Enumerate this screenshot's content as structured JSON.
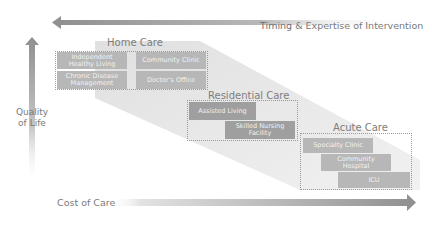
{
  "diagram": {
    "axes": {
      "top": {
        "label_strong": "Timing",
        "label_rest": " & Expertise of Intervention",
        "direction": "left"
      },
      "left": {
        "label_line1": "Quality",
        "label_line2": "of Life",
        "direction": "up"
      },
      "bottom": {
        "label": "Cost of Care",
        "direction": "right"
      }
    },
    "groups": [
      {
        "title": "Home Care",
        "items": [
          {
            "label": "Independent Healthy Living"
          },
          {
            "label": "Chronic Disease Management"
          },
          {
            "label": "Community Clinic"
          },
          {
            "label": "Doctor's Office"
          }
        ]
      },
      {
        "title": "Residential Care",
        "items": [
          {
            "label": "Assisted Living"
          },
          {
            "label": "Skilled Nursing Facility"
          }
        ]
      },
      {
        "title": "Acute Care",
        "items": [
          {
            "label": "Specialty Clinic"
          },
          {
            "label": "Community Hospital"
          },
          {
            "label": "ICU"
          }
        ]
      }
    ],
    "colors": {
      "arrow": "#9e9e9e",
      "cell": "#b7b7b7",
      "cell_dark": "#9f9f9f",
      "band": "#e4e4e4",
      "text": "#7d7d7d"
    }
  }
}
